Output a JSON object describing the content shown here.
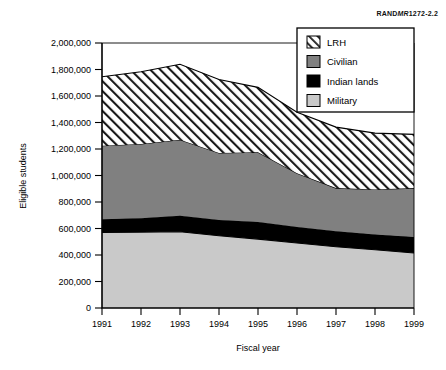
{
  "figure": {
    "source_tag_prefix": "RAND",
    "source_tag_italic": "MR",
    "source_tag_suffix": "1272-2.2"
  },
  "chart_data": {
    "type": "area",
    "stacked": true,
    "title": "",
    "xlabel": "Fiscal year",
    "ylabel": "Eligible students",
    "x": [
      1991,
      1992,
      1993,
      1994,
      1995,
      1996,
      1997,
      1998,
      1999
    ],
    "xtick_labels": [
      "1991",
      "1992",
      "1993",
      "1994",
      "1995",
      "1996",
      "1997",
      "1998",
      "1999"
    ],
    "ylim": [
      0,
      2000000
    ],
    "ytick_values": [
      0,
      200000,
      400000,
      600000,
      800000,
      1000000,
      1200000,
      1400000,
      1600000,
      1800000,
      2000000
    ],
    "ytick_labels": [
      "0",
      "200,000",
      "400,000",
      "600,000",
      "800,000",
      "1,000,000",
      "1,200,000",
      "1,400,000",
      "1,600,000",
      "1,800,000",
      "2,000,000"
    ],
    "grid": false,
    "legend_position": "top-right",
    "series": [
      {
        "name": "Military",
        "fill": "#c9c9c9",
        "pattern": "solid-light",
        "values": [
          570000,
          573000,
          575000,
          545000,
          520000,
          490000,
          462000,
          440000,
          415000
        ]
      },
      {
        "name": "Indian lands",
        "fill": "#000000",
        "pattern": "solid-black",
        "values": [
          100000,
          105000,
          122000,
          120000,
          130000,
          122000,
          118000,
          115000,
          120000
        ]
      },
      {
        "name": "Civilian",
        "fill": "#808080",
        "pattern": "solid-dark",
        "values": [
          555000,
          560000,
          573000,
          505000,
          525000,
          405000,
          325000,
          340000,
          370000
        ]
      },
      {
        "name": "LRH",
        "fill": "#ffffff",
        "pattern": "diagonal-hatch",
        "values": [
          520000,
          545000,
          570000,
          555000,
          490000,
          460000,
          460000,
          425000,
          405000
        ]
      }
    ],
    "cumulative_totals": [
      1745000,
      1783000,
      1840000,
      1725000,
      1665000,
      1477000,
      1365000,
      1320000,
      1310000
    ],
    "legend_order": [
      "LRH",
      "Civilian",
      "Indian lands",
      "Military"
    ]
  }
}
